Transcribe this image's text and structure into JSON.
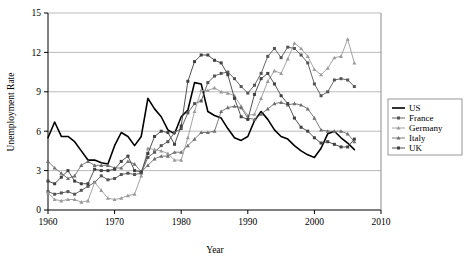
{
  "chart_data": {
    "type": "line",
    "title": "",
    "xlabel": "Year",
    "ylabel": "Unemployment Rate",
    "xlim": [
      1960,
      2010
    ],
    "ylim": [
      0,
      15
    ],
    "xticks": [
      1960,
      1970,
      1980,
      1990,
      2000,
      2010
    ],
    "yticks": [
      0,
      3,
      6,
      9,
      12,
      15
    ],
    "grid": "horizontal",
    "legend_position": "right-outside",
    "x": [
      1960,
      1961,
      1962,
      1963,
      1964,
      1965,
      1966,
      1967,
      1968,
      1969,
      1970,
      1971,
      1972,
      1973,
      1974,
      1975,
      1976,
      1977,
      1978,
      1979,
      1980,
      1981,
      1982,
      1983,
      1984,
      1985,
      1986,
      1987,
      1988,
      1989,
      1990,
      1991,
      1992,
      1993,
      1994,
      1995,
      1996,
      1997,
      1998,
      1999,
      2000,
      2001,
      2002,
      2003,
      2004,
      2005,
      2006
    ],
    "series": [
      {
        "name": "US",
        "color": "#000000",
        "marker": "none",
        "linewidth": 1.6,
        "values": [
          5.5,
          6.7,
          5.6,
          5.6,
          5.2,
          4.5,
          3.8,
          3.8,
          3.6,
          3.5,
          4.9,
          5.9,
          5.6,
          4.9,
          5.6,
          8.5,
          7.7,
          7.1,
          6.1,
          5.8,
          7.1,
          7.6,
          9.7,
          9.6,
          7.5,
          7.2,
          7.0,
          6.2,
          5.5,
          5.3,
          5.6,
          6.8,
          7.5,
          6.9,
          6.1,
          5.6,
          5.4,
          4.9,
          4.5,
          4.2,
          4.0,
          4.7,
          5.8,
          6.0,
          5.5,
          5.1,
          4.6
        ]
      },
      {
        "name": "France",
        "color": "#555555",
        "marker": "square",
        "linewidth": 0.9,
        "values": [
          1.4,
          1.2,
          1.3,
          1.4,
          1.2,
          1.5,
          1.8,
          2.1,
          2.6,
          2.3,
          2.4,
          2.7,
          2.8,
          2.7,
          2.8,
          4.0,
          4.4,
          4.9,
          5.2,
          5.9,
          6.2,
          7.4,
          8.1,
          8.3,
          9.7,
          10.2,
          10.4,
          10.5,
          10.0,
          9.4,
          8.9,
          9.5,
          10.4,
          11.7,
          12.3,
          11.6,
          12.4,
          12.3,
          11.8,
          11.2,
          9.6,
          8.7,
          9.0,
          9.9,
          10.0,
          9.9,
          9.4
        ]
      },
      {
        "name": "Germany",
        "color": "#9a9a9a",
        "marker": "triangle",
        "linewidth": 0.9,
        "values": [
          1.3,
          0.8,
          0.7,
          0.8,
          0.8,
          0.6,
          0.7,
          2.1,
          1.5,
          0.9,
          0.8,
          0.9,
          1.1,
          1.2,
          2.6,
          4.7,
          4.6,
          4.5,
          4.3,
          3.8,
          3.8,
          5.5,
          7.5,
          9.1,
          9.1,
          9.3,
          9.0,
          8.9,
          8.7,
          7.9,
          7.2,
          7.3,
          8.5,
          9.8,
          10.6,
          10.4,
          11.5,
          12.7,
          12.3,
          11.7,
          10.7,
          10.3,
          10.8,
          11.6,
          11.7,
          13.0,
          11.2
        ]
      },
      {
        "name": "Italy",
        "color": "#6e6e6e",
        "marker": "triangle",
        "linewidth": 0.9,
        "values": [
          3.7,
          3.2,
          2.8,
          2.4,
          2.6,
          3.4,
          3.7,
          3.4,
          3.4,
          3.4,
          3.2,
          3.2,
          3.7,
          3.5,
          2.9,
          3.4,
          3.9,
          4.1,
          4.1,
          4.4,
          4.4,
          4.9,
          5.4,
          5.9,
          5.9,
          6.0,
          7.5,
          7.8,
          7.9,
          7.8,
          7.0,
          6.9,
          7.3,
          7.7,
          8.1,
          8.2,
          8.0,
          8.1,
          8.0,
          7.7,
          7.0,
          6.1,
          6.0,
          6.0,
          6.0,
          5.8,
          5.2
        ]
      },
      {
        "name": "UK",
        "color": "#404040",
        "marker": "square",
        "linewidth": 0.9,
        "values": [
          2.2,
          2.0,
          2.5,
          3.0,
          2.2,
          2.0,
          2.0,
          3.1,
          3.0,
          3.0,
          3.1,
          3.7,
          4.1,
          3.0,
          2.9,
          4.3,
          5.6,
          6.0,
          5.9,
          5.0,
          6.4,
          9.8,
          11.3,
          11.8,
          11.8,
          11.4,
          11.2,
          10.3,
          8.5,
          7.1,
          6.9,
          8.8,
          10.0,
          10.4,
          9.6,
          8.7,
          8.1,
          7.0,
          6.3,
          6.0,
          5.5,
          5.1,
          5.2,
          5.0,
          4.8,
          4.8,
          5.4
        ]
      }
    ]
  },
  "legend": {
    "items": [
      {
        "label": "US"
      },
      {
        "label": "France"
      },
      {
        "label": "Germany"
      },
      {
        "label": "Italy"
      },
      {
        "label": "UK"
      }
    ]
  },
  "axes": {
    "y_title": "Unemployment Rate",
    "x_title": "Year",
    "y_tick_labels": [
      "0",
      "3",
      "6",
      "9",
      "12",
      "15"
    ],
    "x_tick_labels": [
      "1960",
      "1970",
      "1980",
      "1990",
      "2000",
      "2010"
    ]
  },
  "colors": {
    "axis": "#000000",
    "gridline": "#b3b3b3",
    "background": "#ffffff"
  }
}
